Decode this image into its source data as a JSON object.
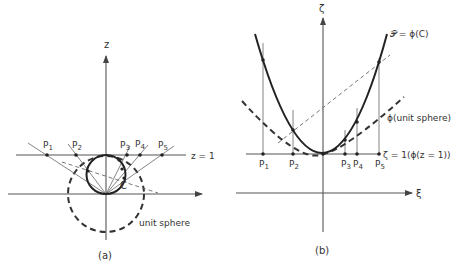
{
  "panel_a": {
    "caption": "(a)",
    "axis_z_label": "z",
    "plane_label": "z = 1",
    "curve_label": "C",
    "sphere_label": "unit sphere",
    "points": [
      {
        "name": "P",
        "sub": "1"
      },
      {
        "name": "P",
        "sub": "2"
      },
      {
        "name": "P",
        "sub": "3"
      },
      {
        "name": "P",
        "sub": "4"
      },
      {
        "name": "P",
        "sub": "5"
      }
    ]
  },
  "panel_b": {
    "caption": "(b)",
    "axis_vertical_label": "ζ",
    "axis_horizontal_label": "ξ",
    "parabola_label": "𝒫 = ϕ(C)",
    "sphere_image_label": "ϕ(unit sphere)",
    "line_label": "ζ = 1(ϕ(z = 1))",
    "points": [
      {
        "name": "P",
        "sub": "1"
      },
      {
        "name": "P",
        "sub": "2"
      },
      {
        "name": "P",
        "sub": "3"
      },
      {
        "name": "P",
        "sub": "4"
      },
      {
        "name": "P",
        "sub": "5"
      }
    ]
  }
}
